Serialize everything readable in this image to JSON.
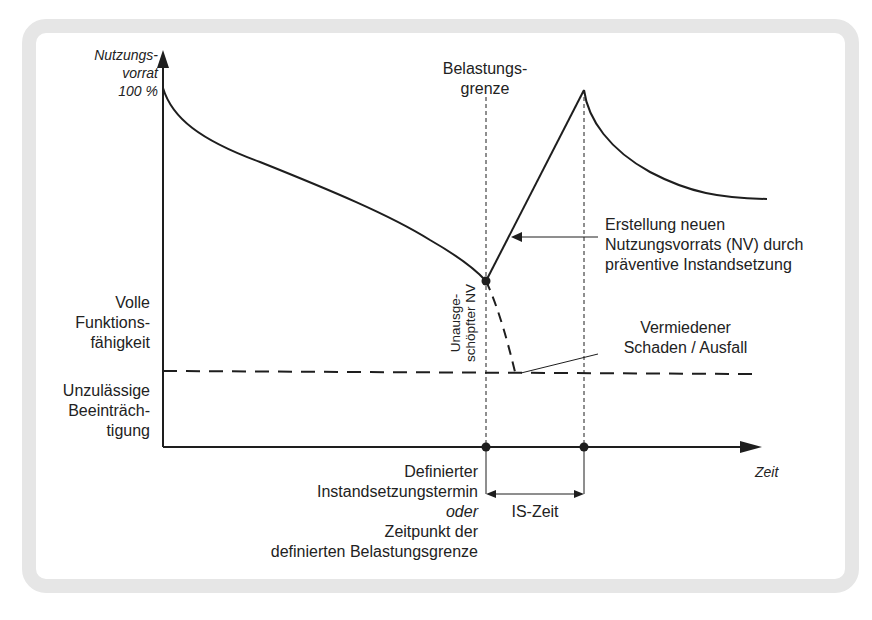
{
  "diagram": {
    "y_axis": {
      "label_line1": "Nutzungs-",
      "label_line2": "vorrat",
      "label_line3": "100 %"
    },
    "x_axis": {
      "label": "Zeit"
    },
    "belastungsgrenze": {
      "line1": "Belastungs-",
      "line2": "grenze"
    },
    "erstellung": {
      "line1": "Erstellung neuen",
      "line2": "Nutzungsvorrats (NV) durch",
      "line3": "präventive Instandsetzung"
    },
    "vermiedener": {
      "line1": "Vermiedener",
      "line2": "Schaden / Ausfall"
    },
    "volle": {
      "line1": "Volle",
      "line2": "Funktions-",
      "line3": "fähigkeit"
    },
    "unzulaessige": {
      "line1": "Unzulässige",
      "line2": "Beeinträch-",
      "line3": "tigung"
    },
    "unausgeschoepfter": {
      "line1": "Unausge-",
      "line2": "schöpfter NV"
    },
    "definierter": {
      "line1": "Definierter",
      "line2": "Instandsetzungstermin",
      "line3": "oder",
      "line4": "Zeitpunkt der",
      "line5": "definierten Belastungsgrenze"
    },
    "is_zeit": {
      "label": "IS-Zeit"
    },
    "colors": {
      "frame": "#e6e6e6",
      "line": "#1e1e1e",
      "background": "#ffffff"
    }
  }
}
